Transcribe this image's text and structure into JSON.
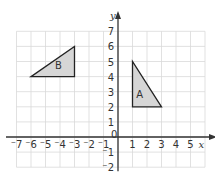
{
  "diagram": {
    "type": "coordinate-grid",
    "x_axis": {
      "label": "x",
      "min": -7,
      "max": 6,
      "tick_labels": [
        "-7",
        "-6",
        "-5",
        "-4",
        "-3",
        "-2",
        "-1",
        "1",
        "2",
        "3",
        "4",
        "5"
      ]
    },
    "y_axis": {
      "label": "y",
      "min": -2,
      "max": 7,
      "tick_labels": [
        "-2",
        "-1",
        "1",
        "2",
        "3",
        "4",
        "5",
        "6",
        "7"
      ]
    },
    "origin_label": "0",
    "shapes": [
      {
        "label": "B",
        "kind": "triangle",
        "vertices": [
          [
            -6,
            4
          ],
          [
            -3,
            4
          ],
          [
            -3,
            6
          ]
        ],
        "label_at": [
          -4.1,
          4.5
        ]
      },
      {
        "label": "A",
        "kind": "triangle",
        "vertices": [
          [
            1,
            5
          ],
          [
            1,
            2
          ],
          [
            3,
            2
          ]
        ],
        "label_at": [
          1.5,
          2.6
        ]
      }
    ],
    "colors": {
      "grid": "#d9d9d9",
      "axis": "#333333",
      "shape_fill": "#d6d6d6",
      "shape_stroke": "#222222"
    }
  }
}
